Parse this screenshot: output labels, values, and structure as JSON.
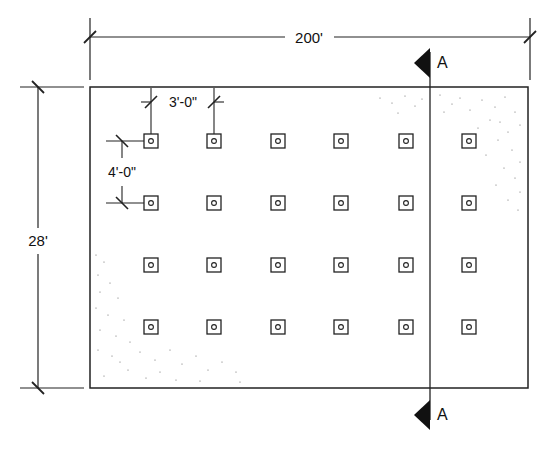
{
  "drawing": {
    "type": "plan",
    "colors": {
      "line": "#222222",
      "stipple": "#555555",
      "background": "#ffffff"
    },
    "dimensions": {
      "overall_width": "200'",
      "overall_depth": "28'",
      "column_spacing": "3'-0\"",
      "row_spacing": "4'-0\""
    },
    "section_marker": {
      "top_label": "A",
      "bottom_label": "A"
    },
    "grid": {
      "columns": 6,
      "rows": 4,
      "col_x": [
        151,
        214,
        278,
        341,
        406,
        469
      ],
      "row_y": [
        141,
        203,
        265,
        327
      ]
    }
  }
}
